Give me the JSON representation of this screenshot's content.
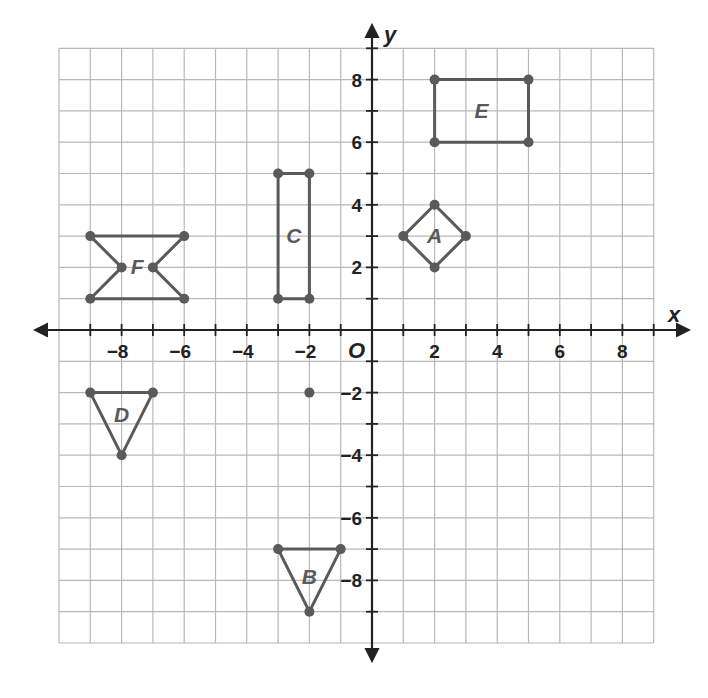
{
  "chart_data": {
    "type": "scatter",
    "title": "",
    "xlabel": "x",
    "ylabel": "y",
    "origin_label": "O",
    "xlim": [
      -10,
      9
    ],
    "ylim": [
      -10,
      9
    ],
    "grid": true,
    "x_ticks": [
      -8,
      -6,
      -4,
      -2,
      2,
      4,
      6,
      8
    ],
    "y_ticks": [
      8,
      6,
      4,
      2,
      -2,
      -4,
      -6,
      -8
    ],
    "shapes": [
      {
        "name": "A",
        "kind": "square (diamond)",
        "vertices": [
          [
            1,
            3
          ],
          [
            2,
            4
          ],
          [
            3,
            3
          ],
          [
            2,
            2
          ]
        ],
        "label_at": [
          2,
          3
        ]
      },
      {
        "name": "B",
        "kind": "triangle",
        "vertices": [
          [
            -3,
            -7
          ],
          [
            -1,
            -7
          ],
          [
            -2,
            -9
          ]
        ],
        "label_at": [
          -2,
          -7.9
        ]
      },
      {
        "name": "C",
        "kind": "rectangle",
        "vertices": [
          [
            -3,
            1
          ],
          [
            -3,
            5
          ],
          [
            -2,
            5
          ],
          [
            -2,
            1
          ]
        ],
        "label_at": [
          -2.5,
          3
        ]
      },
      {
        "name": "D",
        "kind": "triangle",
        "vertices": [
          [
            -9,
            -2
          ],
          [
            -7,
            -2
          ],
          [
            -8,
            -4
          ]
        ],
        "label_at": [
          -8,
          -2.7
        ]
      },
      {
        "name": "E",
        "kind": "rectangle",
        "vertices": [
          [
            2,
            6
          ],
          [
            5,
            6
          ],
          [
            5,
            8
          ],
          [
            2,
            8
          ]
        ],
        "label_at": [
          3.5,
          7
        ]
      },
      {
        "name": "F",
        "kind": "hexagon (bowtie)",
        "vertices": [
          [
            -9,
            3
          ],
          [
            -6,
            3
          ],
          [
            -7,
            2
          ],
          [
            -6,
            1
          ],
          [
            -9,
            1
          ],
          [
            -8,
            2
          ]
        ],
        "label_at": [
          -7.5,
          2
        ]
      }
    ],
    "points": [
      {
        "x": -2,
        "y": -2
      }
    ]
  }
}
